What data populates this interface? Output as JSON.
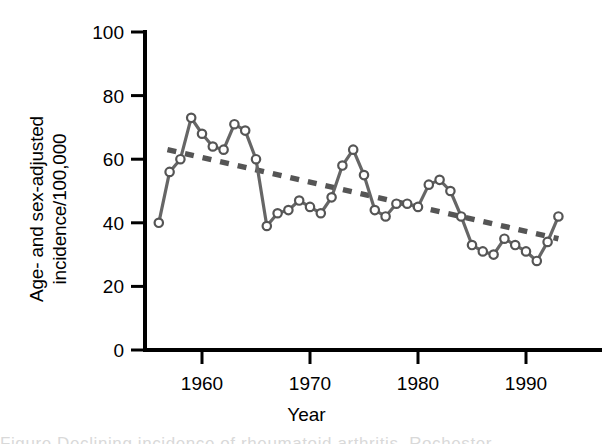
{
  "figure": {
    "ylabel_line1": "Age- and sex-adjusted",
    "ylabel_line2": "incidence/100,000",
    "xlabel": "Year",
    "caption_cropped": "Figure  Declining incidence of rheumatoid arthritis, Rochester"
  },
  "chart_data": {
    "type": "line",
    "title": "",
    "xlabel": "Year",
    "ylabel": "Age- and sex-adjusted incidence/100,000",
    "xlim": [
      1955,
      1995
    ],
    "ylim": [
      0,
      100
    ],
    "xticks": [
      1960,
      1970,
      1980,
      1990
    ],
    "yticks": [
      0,
      20,
      40,
      60,
      80,
      100
    ],
    "grid": false,
    "legend": "none",
    "series": [
      {
        "name": "Age- and sex-adjusted incidence per 100,000",
        "style": "line-with-open-circle-markers",
        "color": "#666666",
        "marker_fill": "#ffffff",
        "marker_edge": "#555555",
        "x": [
          1956,
          1957,
          1958,
          1959,
          1960,
          1961,
          1962,
          1963,
          1964,
          1965,
          1966,
          1967,
          1968,
          1969,
          1970,
          1971,
          1972,
          1973,
          1974,
          1975,
          1976,
          1977,
          1978,
          1979,
          1980,
          1981,
          1982,
          1983,
          1984,
          1985,
          1986,
          1987,
          1988,
          1989,
          1990,
          1991,
          1992,
          1993
        ],
        "y": [
          40,
          56,
          60,
          73,
          68,
          64,
          63,
          71,
          69,
          60,
          39,
          43,
          44,
          47,
          45,
          43,
          48,
          58,
          63,
          55,
          44,
          42,
          46,
          46,
          45,
          52,
          53.5,
          50,
          42,
          33,
          31,
          30,
          35,
          33,
          31,
          28,
          34,
          42
        ]
      },
      {
        "name": "Linear trend",
        "style": "dashed-line",
        "color": "#555555",
        "x": [
          1956.8,
          1993.0
        ],
        "y": [
          63,
          35
        ]
      }
    ]
  }
}
